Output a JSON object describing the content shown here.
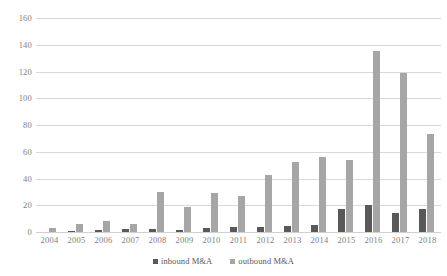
{
  "chart_data": {
    "type": "bar",
    "title": "",
    "subtitle": "",
    "xlabel": "",
    "ylabel": "",
    "categories": [
      "2004",
      "2005",
      "2006",
      "2007",
      "2008",
      "2009",
      "2010",
      "2011",
      "2012",
      "2013",
      "2014",
      "2015",
      "2016",
      "2017",
      "2018"
    ],
    "series": [
      {
        "name": "inbound M&A",
        "color": "#595959",
        "values": [
          0,
          1,
          1.5,
          2,
          2,
          1.5,
          3,
          4,
          4,
          4.5,
          5,
          17,
          20,
          14,
          17
        ]
      },
      {
        "name": "outbound M&A",
        "color": "#a6a6a6",
        "values": [
          3,
          6,
          8,
          6,
          30,
          19,
          29,
          27,
          43,
          52,
          56,
          54,
          135,
          119,
          73
        ]
      }
    ],
    "ylim": [
      0,
      160
    ],
    "yticks": [
      0,
      20,
      40,
      60,
      80,
      100,
      120,
      140,
      160
    ],
    "ytick_labels": [
      "0",
      "20",
      "40",
      "60",
      "80",
      "100",
      "120",
      "140",
      "160"
    ],
    "grid": true,
    "grid_axis": "y",
    "legend_position": "bottom"
  },
  "legend": {
    "items": [
      {
        "label": "inbound M&A",
        "swatch": "inbound"
      },
      {
        "label": "outbound M&A",
        "swatch": "outbound"
      }
    ]
  }
}
